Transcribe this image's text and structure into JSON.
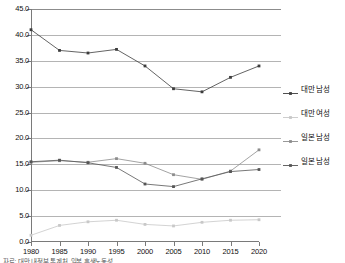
{
  "chart_data": {
    "type": "line",
    "title": "",
    "xlabel": "",
    "ylabel": "",
    "categories": [
      "1980",
      "1985",
      "1990",
      "1995",
      "2000",
      "2005",
      "2010",
      "2015",
      "2020"
    ],
    "x": [
      1980,
      1985,
      1990,
      1995,
      2000,
      2005,
      2010,
      2015,
      2020
    ],
    "ylim": [
      0.0,
      45.0
    ],
    "ytick_values": [
      0.0,
      5.0,
      10.0,
      15.0,
      20.0,
      25.0,
      30.0,
      35.0,
      40.0,
      45.0
    ],
    "ytick_labels": [
      "0.0",
      "5.0",
      "10.0",
      "15.0",
      "20.0",
      "25.0",
      "30.0",
      "35.0",
      "40.0",
      "45.0"
    ],
    "grid": true,
    "legend_position": "right",
    "series": [
      {
        "name": "대만 남성",
        "color": "#3c3c3c",
        "marker": "square",
        "values": [
          41.0,
          37.0,
          36.5,
          37.2,
          34.0,
          29.6,
          29.0,
          31.8,
          34.0
        ]
      },
      {
        "name": "대만 여성",
        "color": "#c8c8c8",
        "marker": "square",
        "values": [
          1.3,
          3.2,
          3.9,
          4.2,
          3.4,
          3.1,
          3.8,
          4.2,
          4.3
        ]
      },
      {
        "name": "일본 남성",
        "color": "#8c8c8c",
        "marker": "square",
        "values": [
          15.4,
          15.7,
          15.4,
          16.1,
          15.2,
          13.0,
          12.1,
          13.7,
          17.8
        ]
      },
      {
        "name": "일본 남성",
        "color": "#555555",
        "marker": "square",
        "values": [
          15.5,
          15.8,
          15.3,
          14.4,
          11.2,
          10.7,
          12.2,
          13.6,
          14.0
        ]
      }
    ]
  },
  "legend": {
    "items": [
      {
        "label": "대만 남성"
      },
      {
        "label": "대만 여성"
      },
      {
        "label": "일본 남성"
      },
      {
        "label": "일본 남성"
      }
    ]
  },
  "caption": {
    "text": "자료: 대만 내정부 통계처, 일본 후생노동성"
  }
}
